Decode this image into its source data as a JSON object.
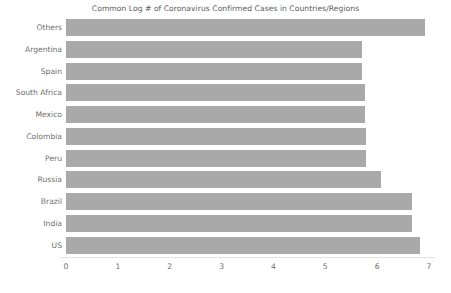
{
  "chart_data": {
    "type": "bar",
    "orientation": "horizontal",
    "title": "Common Log # of Coronavirus Confirmed Cases in Countries/Regions",
    "subtitle": "",
    "xlabel": "",
    "ylabel": "",
    "xlim": [
      0,
      7
    ],
    "ylim": null,
    "grid": false,
    "legend": null,
    "xticks": [
      "0",
      "1",
      "2",
      "3",
      "4",
      "5",
      "6",
      "7"
    ],
    "xtick_values": [
      0,
      1,
      2,
      3,
      4,
      5,
      6,
      7
    ],
    "categories": [
      "Others",
      "Argentina",
      "Spain",
      "South Africa",
      "Mexico",
      "Colombia",
      "Peru",
      "Russia",
      "Brazil",
      "India",
      "US"
    ],
    "values": [
      6.93,
      5.71,
      5.7,
      5.76,
      5.76,
      5.78,
      5.78,
      6.07,
      6.68,
      6.68,
      6.82
    ],
    "bar_color": "#a9a9a9",
    "background_color": "#ffffff",
    "axis_text_color": "#6e6e6e",
    "title_color": "#5a5a5a"
  }
}
